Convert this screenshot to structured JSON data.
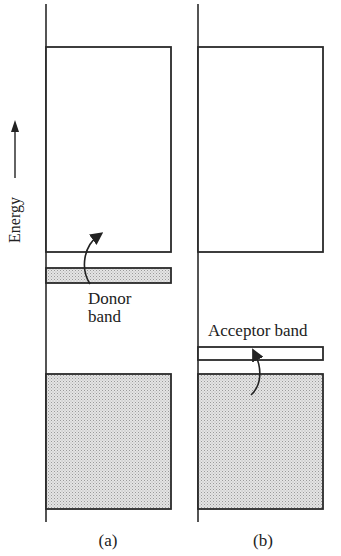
{
  "figure": {
    "axis_label": "Energy",
    "panels": [
      {
        "id": "a",
        "caption": "(a)",
        "annotation_line1": "Donor",
        "annotation_line2": "band",
        "bands": [
          {
            "name": "conduction band",
            "filled": false
          },
          {
            "name": "donor band",
            "filled": true
          },
          {
            "name": "valence band",
            "filled": true
          }
        ]
      },
      {
        "id": "b",
        "caption": "(b)",
        "annotation_line1": "Acceptor band",
        "bands": [
          {
            "name": "conduction band",
            "filled": false
          },
          {
            "name": "acceptor band",
            "filled": false
          },
          {
            "name": "valence band",
            "filled": true
          }
        ]
      }
    ],
    "colors": {
      "line": "#2a2a2a",
      "fill": "#d9d9d9",
      "background": "#ffffff"
    }
  }
}
